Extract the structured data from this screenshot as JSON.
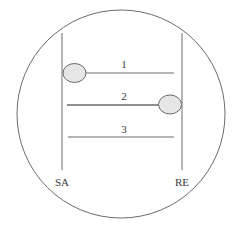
{
  "diagram": {
    "colors": {
      "stroke": "#6a6a6a",
      "ellipse_fill": "#e6e6e6",
      "text": "#3a3a3a",
      "background": "#ffffff"
    },
    "boundary": {
      "cx": 121,
      "cy": 114,
      "r": 104
    },
    "posts": [
      {
        "id": "sa",
        "label": "SA",
        "x": 62,
        "y1": 33,
        "y2": 170,
        "label_x": 62,
        "label_y": 184
      },
      {
        "id": "re",
        "label": "RE",
        "x": 182,
        "y1": 33,
        "y2": 170,
        "label_x": 182,
        "label_y": 184
      }
    ],
    "bonds": [
      {
        "label": "1",
        "x1": 86,
        "x2": 174,
        "y": 73,
        "label_y": 68,
        "ellipse": {
          "side": "SA",
          "cx": 74,
          "cy": 73
        }
      },
      {
        "label": "2",
        "x1": 66,
        "x2": 159,
        "y": 105,
        "label_y": 99,
        "ellipse": {
          "side": "RE",
          "cx": 170,
          "cy": 105
        }
      },
      {
        "label": "3",
        "x1": 68,
        "x2": 174,
        "y": 137,
        "label_y": 132,
        "ellipse": null
      }
    ]
  }
}
